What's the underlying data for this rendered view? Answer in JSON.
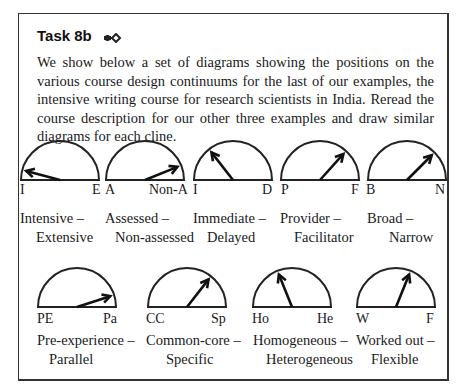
{
  "task": {
    "title": "Task 8b",
    "icon": "arrow-diamond-icon",
    "intro": "We show below a set of diagrams showing the positions on the various course design continuums for the last of our examples, the intensive writing course for research scientists in India. Reread the course description for our other three examples and draw similar diagrams for each cline."
  },
  "diagrams": [
    {
      "left_end": "I",
      "right_end": "E",
      "name_line1": "Intensive –",
      "name_line2": "Extensive",
      "pointer_angle_deg": 165
    },
    {
      "left_end": "A",
      "right_end": "Non-A",
      "name_line1": "Assessed –",
      "name_line2": "Non-assessed",
      "pointer_angle_deg": 22
    },
    {
      "left_end": "I",
      "right_end": "D",
      "name_line1": "Immediate –",
      "name_line2": "Delayed",
      "pointer_angle_deg": 128
    },
    {
      "left_end": "P",
      "right_end": "F",
      "name_line1": "Provider –",
      "name_line2": "Facilitator",
      "pointer_angle_deg": 48
    },
    {
      "left_end": "B",
      "right_end": "N",
      "name_line1": "Broad –",
      "name_line2": "Narrow",
      "pointer_angle_deg": 45
    },
    {
      "left_end": "PE",
      "right_end": "Pa",
      "name_line1": "Pre-experience –",
      "name_line2": "Parallel",
      "pointer_angle_deg": 18
    },
    {
      "left_end": "CC",
      "right_end": "Sp",
      "name_line1": "Common-core –",
      "name_line2": "Specific",
      "pointer_angle_deg": 52
    },
    {
      "left_end": "Ho",
      "right_end": "He",
      "name_line1": "Homogeneous –",
      "name_line2": "Heterogeneous",
      "pointer_angle_deg": 112
    },
    {
      "left_end": "W",
      "right_end": "F",
      "name_line1": "Worked out –",
      "name_line2": "Flexible",
      "pointer_angle_deg": 68
    }
  ]
}
